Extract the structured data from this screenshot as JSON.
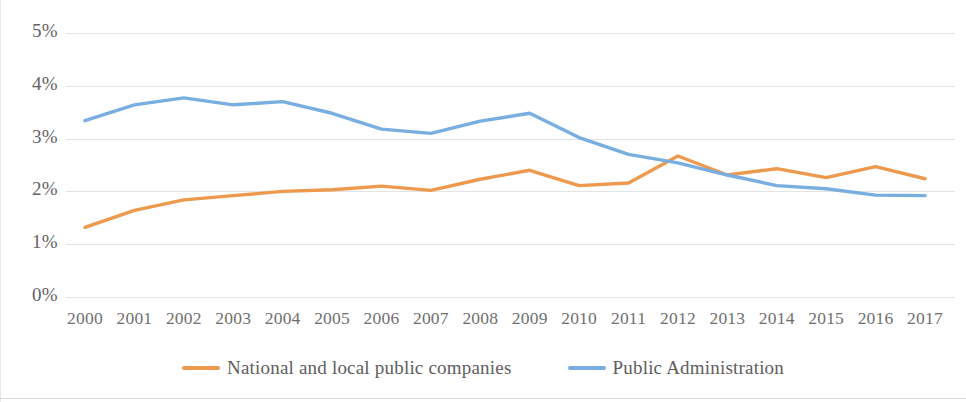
{
  "chart_data": {
    "type": "line",
    "title": "",
    "subtitle": "",
    "xlabel": "",
    "ylabel": "",
    "categories": [
      "2000",
      "2001",
      "2002",
      "2003",
      "2004",
      "2005",
      "2006",
      "2007",
      "2008",
      "2009",
      "2010",
      "2011",
      "2012",
      "2013",
      "2014",
      "2015",
      "2016",
      "2017"
    ],
    "ytick_labels": [
      "5%",
      "4%",
      "3%",
      "2%",
      "1%",
      "0%"
    ],
    "ytick_values": [
      5,
      4,
      3,
      2,
      1,
      0
    ],
    "ylim": [
      0,
      5
    ],
    "grid": true,
    "legend_position": "bottom-center",
    "series": [
      {
        "name": "National and local public companies",
        "color": "#ED9A4E",
        "values": [
          1.32,
          1.64,
          1.84,
          1.92,
          2.0,
          2.03,
          2.1,
          2.02,
          2.23,
          2.4,
          2.11,
          2.16,
          2.67,
          2.31,
          2.43,
          2.26,
          2.47,
          2.24
        ]
      },
      {
        "name": "Public Administration",
        "color": "#78AEE0",
        "values": [
          3.34,
          3.64,
          3.77,
          3.64,
          3.7,
          3.48,
          3.18,
          3.1,
          3.33,
          3.48,
          3.02,
          2.7,
          2.54,
          2.31,
          2.11,
          2.05,
          1.93,
          1.92
        ]
      }
    ]
  },
  "legend": {
    "items": [
      {
        "label": "National and local public companies",
        "color": "#ED9A4E"
      },
      {
        "label": "Public Administration",
        "color": "#78AEE0"
      }
    ]
  },
  "colors": {
    "series_orange": "#ED9A4E",
    "series_blue": "#78AEE0",
    "gridline": "#e4e4e4",
    "axis_text": "#6f6f6f",
    "background": "#ffffff"
  }
}
